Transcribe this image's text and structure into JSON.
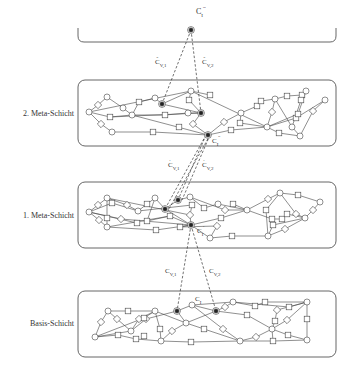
{
  "diagram": {
    "top_node": {
      "label": "C",
      "sub": "I",
      "sup": "'''"
    },
    "layers": [
      {
        "name": "2. Meta-Schicht",
        "links_from_above": [
          {
            "label": "C",
            "sub": "V,1",
            "sup": "''"
          },
          {
            "label": "C",
            "sub": "V,2",
            "sup": "''"
          }
        ],
        "hub": {
          "label": "C",
          "sub": "I",
          "sup": "''"
        }
      },
      {
        "name": "1. Meta-Schicht",
        "links_from_above": [
          {
            "label": "C",
            "sub": "V,1",
            "sup": "'"
          },
          {
            "label": "C",
            "sub": "V,2",
            "sup": "'"
          }
        ],
        "hub": {
          "label": "C",
          "sub": "I",
          "sup": "'"
        }
      },
      {
        "name": "Basis-Schicht",
        "links_from_above": [
          {
            "label": "C",
            "sub": "V,1",
            "sup": ""
          },
          {
            "label": "C",
            "sub": "V,2",
            "sup": ""
          }
        ],
        "hub": {
          "label": "C",
          "sub": "I",
          "sup": ""
        }
      }
    ]
  }
}
